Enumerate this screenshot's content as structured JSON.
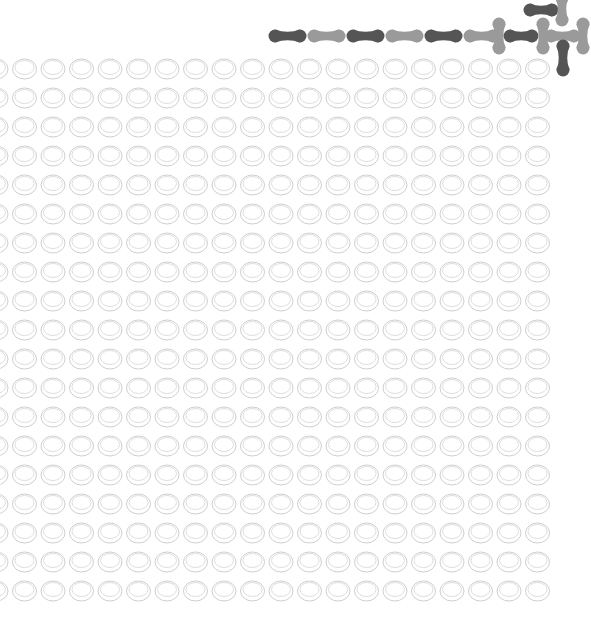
{
  "canvas": {
    "width": 591,
    "height": 644,
    "background": "#ffffff"
  },
  "ring_grid": {
    "rows": 19,
    "cols": 20,
    "start_x": -4,
    "start_y": 69,
    "dx": 28.5,
    "dy": 29,
    "rx": 12,
    "ry": 10,
    "stroke": "#cfcfcf",
    "inner_stroke": "#dedede"
  },
  "colors": {
    "dark": "#555555",
    "light": "#9a9a9a"
  },
  "dumbbells": [
    {
      "tone": "dark",
      "orient": "h",
      "x1": 275,
      "y1": 36,
      "x2": 300,
      "y2": 36
    },
    {
      "tone": "light",
      "orient": "h",
      "x1": 314,
      "y1": 36,
      "x2": 339,
      "y2": 36
    },
    {
      "tone": "dark",
      "orient": "h",
      "x1": 353,
      "y1": 36,
      "x2": 378,
      "y2": 36
    },
    {
      "tone": "light",
      "orient": "h",
      "x1": 392,
      "y1": 36,
      "x2": 417,
      "y2": 36
    },
    {
      "tone": "dark",
      "orient": "h",
      "x1": 431,
      "y1": 36,
      "x2": 456,
      "y2": 36
    },
    {
      "tone": "light",
      "orient": "h",
      "x1": 470,
      "y1": 36,
      "x2": 493,
      "y2": 36
    },
    {
      "tone": "light",
      "orient": "v",
      "x1": 499,
      "y1": 24,
      "x2": 499,
      "y2": 48
    },
    {
      "tone": "dark",
      "orient": "h",
      "x1": 510,
      "y1": 36,
      "x2": 532,
      "y2": 36
    },
    {
      "tone": "light",
      "orient": "v",
      "x1": 543,
      "y1": 24,
      "x2": 543,
      "y2": 48
    },
    {
      "tone": "light",
      "orient": "h",
      "x1": 551,
      "y1": 36,
      "x2": 574,
      "y2": 36
    },
    {
      "tone": "light",
      "orient": "v",
      "x1": 583,
      "y1": 24,
      "x2": 583,
      "y2": 48
    },
    {
      "tone": "dark",
      "orient": "v",
      "x1": 563,
      "y1": 46,
      "x2": 563,
      "y2": 70
    },
    {
      "tone": "dark",
      "orient": "h",
      "x1": 530,
      "y1": 10,
      "x2": 552,
      "y2": 10
    },
    {
      "tone": "light",
      "orient": "v",
      "x1": 562,
      "y1": -2,
      "x2": 562,
      "y2": 20
    }
  ]
}
